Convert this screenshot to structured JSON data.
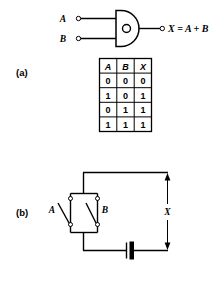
{
  "figure": {
    "panels": [
      {
        "key": "a",
        "label": "(a)",
        "gate": {
          "type": "or-gate",
          "inputs": [
            {
              "name": "A",
              "label": "A"
            },
            {
              "name": "B",
              "label": "B"
            }
          ],
          "output_label": "X = A + B",
          "inner_mark": "O"
        },
        "truth_table": {
          "headers": [
            "A",
            "B",
            "X"
          ],
          "rows": [
            [
              "0",
              "0",
              "0"
            ],
            [
              "1",
              "0",
              "1"
            ],
            [
              "0",
              "1",
              "1"
            ],
            [
              "1",
              "1",
              "1"
            ]
          ]
        }
      },
      {
        "key": "b",
        "label": "(b)",
        "circuit": {
          "type": "parallel-switches",
          "switch_a_label": "A",
          "switch_b_label": "B",
          "output_label": "X",
          "source": "battery"
        }
      }
    ]
  },
  "colors": {
    "ink": "#000000",
    "background": "#ffffff"
  }
}
